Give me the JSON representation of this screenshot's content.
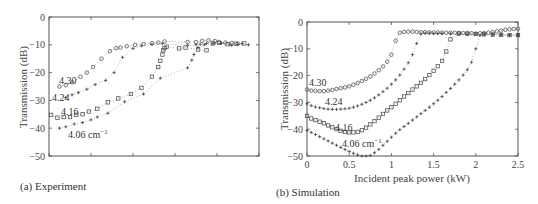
{
  "chart_data": [
    {
      "id": "a",
      "type": "scatter",
      "caption": "(a) Experiment",
      "title": "",
      "xlabel": "",
      "ylabel": "Transmission (dB)",
      "ylim": [
        -50,
        0
      ],
      "yticks": [
        0,
        -10,
        -20,
        -30,
        -40,
        -50
      ],
      "ytick_labels": [
        "0",
        "−10",
        "−20",
        "−30",
        "−40",
        "−50"
      ],
      "xticks_visible_labels": false,
      "xlim": [
        0,
        5
      ],
      "xticks": [
        0,
        1,
        2,
        3,
        4,
        5
      ],
      "grid": false,
      "series": [
        {
          "name": "4.30",
          "marker": "circle",
          "x": [
            0.25,
            0.4,
            0.55,
            0.75,
            0.9,
            1.05,
            1.25,
            1.45,
            1.6,
            1.7,
            1.85,
            2.05,
            2.25,
            2.45,
            2.6,
            2.75,
            3.3,
            3.5,
            3.65,
            3.8,
            3.95,
            4.05,
            4.2,
            4.35,
            4.5
          ],
          "y": [
            -25,
            -24.5,
            -23.5,
            -21.5,
            -20,
            -18,
            -15,
            -12.3,
            -11.2,
            -11,
            -10.5,
            -10,
            -9.7,
            -9.4,
            -9.2,
            -8.8,
            -9,
            -9,
            -8.6,
            -8.4,
            -8.6,
            -9,
            -9.2,
            -9.4,
            -9.6
          ]
        },
        {
          "name": "4.24",
          "marker": "plus",
          "x": [
            0.4,
            0.55,
            0.7,
            0.9,
            1.1,
            1.35,
            1.55,
            1.75,
            2.0,
            2.2,
            2.45,
            2.7,
            3.3,
            3.5,
            3.6,
            3.75,
            3.95,
            4.1,
            4.3,
            4.5,
            4.75
          ],
          "y": [
            -29,
            -28,
            -27.2,
            -26,
            -24.3,
            -22.8,
            -20,
            -14.5,
            -11.3,
            -10.4,
            -9.9,
            -9.6,
            -10.2,
            -10,
            -9.8,
            -9.5,
            -9.4,
            -9.5,
            -9.8,
            -9.9,
            -10
          ]
        },
        {
          "name": "4.16",
          "marker": "square",
          "x": [
            0.05,
            0.2,
            0.35,
            0.5,
            0.65,
            0.8,
            0.95,
            1.15,
            1.4,
            1.65,
            1.95,
            2.2,
            2.45,
            2.6,
            2.65,
            2.7,
            2.72,
            2.75,
            2.8,
            3.1,
            3.25,
            3.55,
            3.75,
            3.9,
            4.05,
            4.25,
            4.45,
            4.65
          ],
          "y": [
            -35.2,
            -36.2,
            -36,
            -36,
            -35.2,
            -35,
            -34,
            -33,
            -30.7,
            -29.3,
            -27.7,
            -25.5,
            -21.5,
            -18,
            -15.8,
            -13.5,
            -12,
            -11.2,
            -10.7,
            -11.3,
            -11,
            -11.7,
            -12,
            -9.5,
            -9.3,
            -9.8,
            -9.6,
            -9.5
          ]
        },
        {
          "name": "4.06 cm−1",
          "marker": "plus",
          "x": [
            0.25,
            0.4,
            0.6,
            0.8,
            1.0,
            1.15,
            1.4,
            1.8,
            2.25,
            2.65,
            3.3,
            3.4,
            3.45,
            3.55,
            3.7,
            3.9,
            4.1,
            4.35,
            4.6
          ],
          "y": [
            -40,
            -39.5,
            -38.5,
            -38,
            -37,
            -36,
            -34.6,
            -30.5,
            -27.7,
            -22,
            -18.3,
            -15.5,
            -13.5,
            -11,
            -10,
            -9.6,
            -9.4,
            -10.2,
            -9.5
          ]
        }
      ],
      "annotations": [
        "4.30",
        "4.24",
        "4.16",
        "4.06 cm−1"
      ]
    },
    {
      "id": "b",
      "type": "scatter",
      "caption": "(b)  Simulation",
      "title": "",
      "xlabel": "Incident peak power (kW)",
      "ylabel": "Transmission (dB)",
      "xlim": [
        0,
        2.5
      ],
      "ylim": [
        -50,
        0
      ],
      "xticks": [
        0,
        0.5,
        1,
        1.5,
        2,
        2.5
      ],
      "xtick_labels": [
        "0",
        "0.5",
        "1",
        "1.5",
        "2",
        "2.5"
      ],
      "yticks": [
        0,
        -10,
        -20,
        -30,
        -40,
        -50
      ],
      "ytick_labels": [
        "0",
        "−10",
        "−20",
        "−30",
        "−40",
        "−50"
      ],
      "grid": false,
      "series": [
        {
          "name": "4.30",
          "marker": "circle",
          "x": [
            0,
            0.05,
            0.1,
            0.15,
            0.2,
            0.25,
            0.3,
            0.35,
            0.4,
            0.45,
            0.5,
            0.55,
            0.6,
            0.65,
            0.7,
            0.75,
            0.8,
            0.85,
            0.9,
            0.95,
            1.0,
            1.05,
            1.1,
            1.15,
            1.2,
            1.25,
            1.3,
            1.35,
            1.4,
            1.45,
            1.5,
            1.55,
            1.6,
            1.65,
            1.7,
            1.75,
            1.8,
            1.85,
            1.9,
            1.95,
            2.0,
            2.05,
            2.1,
            2.15,
            2.2,
            2.25,
            2.3,
            2.35,
            2.4,
            2.45,
            2.5
          ],
          "y": [
            -25.2,
            -25.6,
            -25.7,
            -25.8,
            -25.8,
            -25.6,
            -25.4,
            -25,
            -24.7,
            -24.4,
            -24,
            -23.4,
            -22.8,
            -22,
            -21.2,
            -20.3,
            -19.2,
            -18,
            -16.6,
            -14.8,
            -12.2,
            -7,
            -4,
            -3.7,
            -3.6,
            -3.6,
            -3.7,
            -3.8,
            -3.8,
            -3.9,
            -3.9,
            -3.9,
            -4,
            -4,
            -4,
            -4,
            -4.1,
            -4.1,
            -4.1,
            -4.2,
            -4.3,
            -4.2,
            -4.1,
            -4,
            -3.8,
            -3.5,
            -3.2,
            -2.9,
            -2.7,
            -2.6,
            -2.5
          ]
        },
        {
          "name": "4.24",
          "marker": "plus",
          "x": [
            0,
            0.05,
            0.1,
            0.15,
            0.2,
            0.25,
            0.3,
            0.35,
            0.4,
            0.45,
            0.5,
            0.55,
            0.6,
            0.65,
            0.7,
            0.75,
            0.8,
            0.85,
            0.9,
            0.95,
            1.0,
            1.05,
            1.1,
            1.15,
            1.2,
            1.25,
            1.3,
            1.35,
            1.4,
            1.45,
            1.5,
            1.55,
            1.6,
            1.7,
            1.8,
            1.9,
            2.0,
            2.1,
            2.2,
            2.3,
            2.4,
            2.5
          ],
          "y": [
            -30.5,
            -31.2,
            -31.7,
            -32,
            -32.3,
            -32.5,
            -32.6,
            -32.6,
            -32.5,
            -32.4,
            -32.2,
            -31.8,
            -31.3,
            -30.7,
            -30,
            -29.2,
            -28.3,
            -27.2,
            -26,
            -24.7,
            -23.2,
            -21.6,
            -19.8,
            -17.6,
            -15.2,
            -12.2,
            -8,
            -4.5,
            -4.2,
            -4.2,
            -4.3,
            -4.3,
            -4.3,
            -4.4,
            -4.5,
            -4.5,
            -4.5,
            -4.6,
            -4.6,
            -4.7,
            -4.8,
            -4.8
          ]
        },
        {
          "name": "4.16",
          "marker": "square",
          "x": [
            0,
            0.05,
            0.1,
            0.15,
            0.2,
            0.25,
            0.3,
            0.35,
            0.4,
            0.45,
            0.5,
            0.55,
            0.6,
            0.65,
            0.7,
            0.75,
            0.8,
            0.85,
            0.9,
            0.95,
            1.0,
            1.05,
            1.1,
            1.15,
            1.2,
            1.25,
            1.3,
            1.35,
            1.4,
            1.45,
            1.5,
            1.55,
            1.6,
            1.65,
            1.7,
            1.8,
            1.9,
            2.0,
            2.1,
            2.2,
            2.3,
            2.4,
            2.5
          ],
          "y": [
            -35,
            -36,
            -36.6,
            -37.2,
            -37.8,
            -38.6,
            -39.3,
            -40,
            -40.6,
            -41,
            -41.2,
            -41.2,
            -41,
            -40.4,
            -39.4,
            -38.2,
            -37,
            -35.7,
            -34.3,
            -33,
            -31.8,
            -30.5,
            -29.2,
            -27.8,
            -26.5,
            -25.2,
            -24,
            -22.7,
            -21.3,
            -19.8,
            -18.2,
            -16.5,
            -14.5,
            -11,
            -6.5,
            -4.3,
            -4.4,
            -4.5,
            -4.6,
            -4.7,
            -4.8,
            -4.9,
            -4.9
          ]
        },
        {
          "name": "4.06 cm−1",
          "marker": "plus",
          "x": [
            0,
            0.05,
            0.1,
            0.15,
            0.2,
            0.25,
            0.3,
            0.35,
            0.4,
            0.45,
            0.5,
            0.55,
            0.6,
            0.65,
            0.7,
            0.75,
            0.8,
            0.85,
            0.9,
            0.95,
            1.0,
            1.05,
            1.1,
            1.15,
            1.2,
            1.25,
            1.3,
            1.35,
            1.4,
            1.45,
            1.5,
            1.55,
            1.6,
            1.65,
            1.7,
            1.75,
            1.8,
            1.85,
            1.9,
            1.95,
            2.0,
            2.05,
            2.1,
            2.2,
            2.3,
            2.4,
            2.5
          ],
          "y": [
            -40.5,
            -41.2,
            -42,
            -42.8,
            -43.6,
            -44.4,
            -45.2,
            -46,
            -46.8,
            -47.6,
            -48.3,
            -49,
            -49.6,
            -50,
            -50,
            -49.8,
            -48.8,
            -47.5,
            -46,
            -44.5,
            -43,
            -41.5,
            -40.2,
            -39,
            -37.8,
            -36.6,
            -35.4,
            -34.2,
            -33,
            -31.8,
            -30.5,
            -29.2,
            -27.8,
            -26.3,
            -24.8,
            -23.2,
            -21.6,
            -19.8,
            -17.8,
            -15,
            -10,
            -5,
            -4.7,
            -4.8,
            -4.9,
            -5,
            -5
          ]
        }
      ],
      "annotations": [
        "4.30",
        "4.24",
        "4.16",
        "4.06 cm−1"
      ]
    }
  ],
  "panels": {
    "a": {
      "caption": "(a) Experiment",
      "ylabel": "Transmission (dB)",
      "ytick_labels": [
        "0",
        "−10",
        "−20",
        "−30",
        "−40",
        "−50"
      ],
      "labels": {
        "s1": "4.30",
        "s2": "4.24",
        "s3": "4.16",
        "s4": "4.06 cm",
        "s4_sup": "−1"
      }
    },
    "b": {
      "caption": "(b)  Simulation",
      "xlabel": "Incident peak power (kW)",
      "ylabel": "Transmission (dB)",
      "xtick_labels": [
        "0",
        "0.5",
        "1",
        "1.5",
        "2",
        "2.5"
      ],
      "ytick_labels": [
        "0",
        "−10",
        "−20",
        "−30",
        "−40",
        "−50"
      ],
      "labels": {
        "s1": "4.30",
        "s2": "4.24",
        "s3": "4.16",
        "s4": "4.06 cm",
        "s4_sup": "−1"
      }
    }
  },
  "colors": {
    "axis": "#555555",
    "marker": "#444444",
    "dotted_line": "#9a9a9a",
    "text": "#3a3a3a"
  }
}
